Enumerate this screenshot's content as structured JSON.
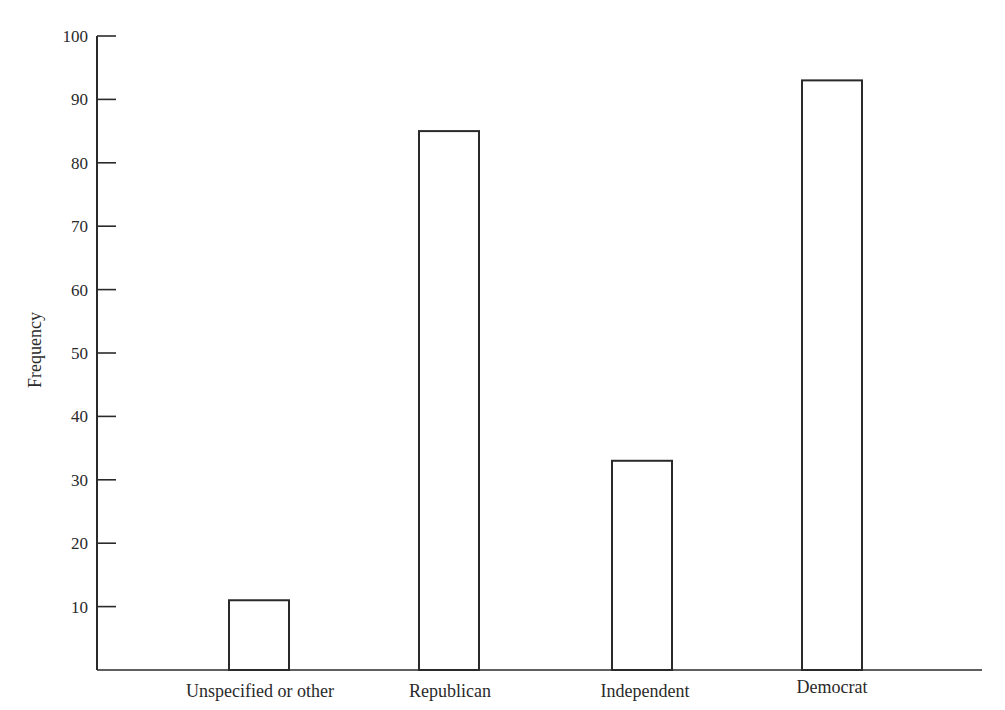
{
  "chart_data": {
    "type": "bar",
    "title": "",
    "xlabel": "",
    "ylabel": "Frequency",
    "categories": [
      "Unspecified or other",
      "Republican",
      "Independent",
      "Democrat"
    ],
    "values": [
      11,
      85,
      33,
      93
    ],
    "ylim": [
      0,
      100
    ],
    "yticks": [
      10,
      20,
      30,
      40,
      50,
      60,
      70,
      80,
      90,
      100
    ],
    "grid": false,
    "legend": null,
    "bar_style": "outline"
  },
  "colors": {
    "ink": "#2a2a2a",
    "background": "#ffffff"
  }
}
